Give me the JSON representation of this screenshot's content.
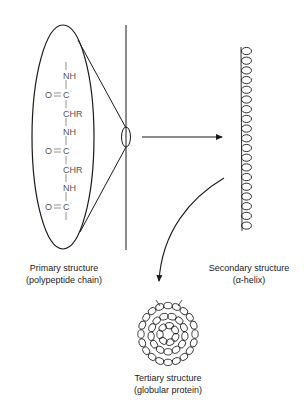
{
  "diagram": {
    "primary": {
      "title": "Primary structure",
      "subtitle": "(polypeptide chain)",
      "chain": [
        {
          "type": "bond",
          "text": "|"
        },
        {
          "type": "group",
          "text": "NH"
        },
        {
          "type": "group",
          "text": "C",
          "carbonyl": "O="
        },
        {
          "type": "group",
          "text": "CHR"
        },
        {
          "type": "group",
          "text": "NH"
        },
        {
          "type": "group",
          "text": "C",
          "carbonyl": "O="
        },
        {
          "type": "group",
          "text": "CHR"
        },
        {
          "type": "group",
          "text": "NH"
        },
        {
          "type": "group",
          "text": "C",
          "carbonyl": "O="
        }
      ]
    },
    "secondary": {
      "title": "Secondary structure",
      "subtitle": "(α-helix)"
    },
    "tertiary": {
      "title": "Tertiary structure",
      "subtitle": "(globular protein)"
    },
    "chem_labels": {
      "nh": "NH",
      "c": "C",
      "chr": "CHR",
      "o_double": "O═"
    },
    "colors": {
      "line": "#1a1a1a",
      "chem_text": "#555555",
      "background": "#ffffff"
    }
  }
}
